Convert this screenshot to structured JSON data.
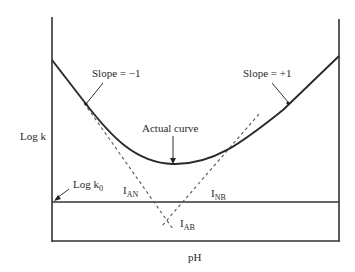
{
  "labels": {
    "y_axis": "Log k",
    "x_axis": "pH",
    "slope_left": "Slope = −1",
    "slope_right": "Slope = +1",
    "actual_curve": "Actual curve",
    "log_k0_main": "Log k",
    "log_k0_sub": "0",
    "i_an_main": "I",
    "i_an_sub": "AN",
    "i_nb_main": "I",
    "i_nb_sub": "NB",
    "i_ab_main": "I",
    "i_ab_sub": "AB"
  },
  "colors": {
    "line": "#333333",
    "dashed": "#555555",
    "background": "#ffffff"
  }
}
